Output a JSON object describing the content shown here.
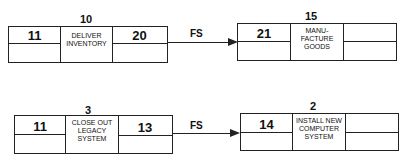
{
  "nodes": [
    {
      "id": "deliver",
      "duration": "10",
      "early_start": "11",
      "desc": "DELIVER\nINVENTORY",
      "early_finish": "20",
      "late_start": "",
      "late_finish": ""
    },
    {
      "id": "manufacture",
      "duration": "15",
      "early_start": "21",
      "desc": "MANU-\nFACTURE\nGOODS",
      "early_finish": "",
      "late_start": "",
      "late_finish": ""
    },
    {
      "id": "closeout",
      "duration": "3",
      "early_start": "11",
      "desc": "CLOSE OUT\nLEGACY\nSYSTEM",
      "early_finish": "13",
      "late_start": "",
      "late_finish": ""
    },
    {
      "id": "install",
      "duration": "2",
      "early_start": "14",
      "desc": "INSTALL NEW\nCOMPUTER\nSYSTEM",
      "early_finish": "",
      "late_start": "",
      "late_finish": ""
    }
  ],
  "links": [
    {
      "from": "deliver",
      "to": "manufacture",
      "type": "FS"
    },
    {
      "from": "closeout",
      "to": "install",
      "type": "FS"
    }
  ]
}
